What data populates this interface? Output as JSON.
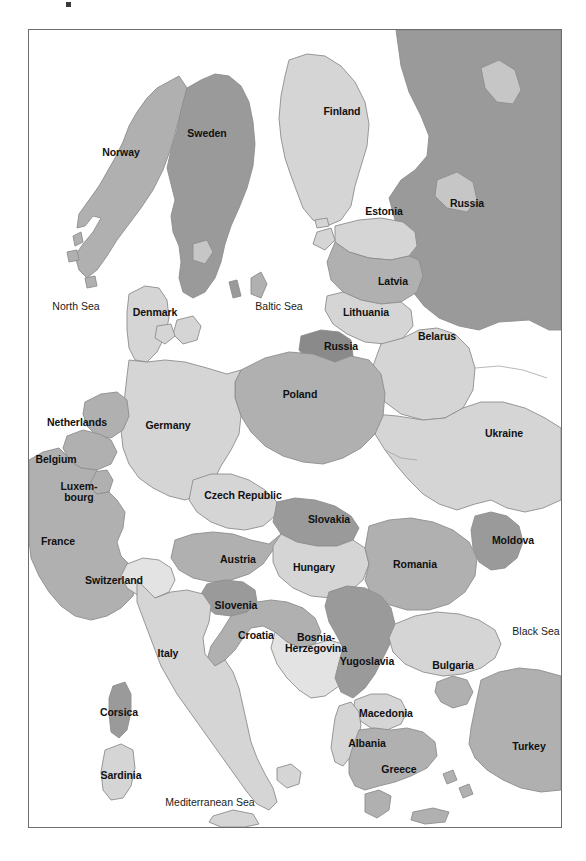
{
  "figure": {
    "kind": "political-map",
    "region": "Europe",
    "frame": {
      "x": 28,
      "y": 29,
      "width": 534,
      "height": 799,
      "border_color": "#6d6d6d"
    },
    "background": "#ffffff"
  },
  "palette": {
    "water": "#ffffff",
    "tone_lightest": "#e3e3e3",
    "tone_light": "#d5d5d5",
    "tone_medium_light": "#c6c6c6",
    "tone_medium": "#b0b0b0",
    "tone_medium_dark": "#9a9a9a",
    "tone_dark": "#8a8a8a",
    "tone_darkest": "#7b7b7b",
    "border_line": "#8d8d8d",
    "frame_line": "#6d6d6d",
    "label_text": "#111111"
  },
  "labels": {
    "countries": [
      {
        "name": "Norway",
        "text": "Norway",
        "x": 92,
        "y": 123,
        "tone": "tone_medium"
      },
      {
        "name": "Sweden",
        "text": "Sweden",
        "x": 178,
        "y": 104,
        "tone": "tone_medium_dark"
      },
      {
        "name": "Finland",
        "text": "Finland",
        "x": 313,
        "y": 82,
        "tone": "tone_light"
      },
      {
        "name": "Russia",
        "text": "Russia",
        "x": 438,
        "y": 174,
        "tone": "tone_medium_dark"
      },
      {
        "name": "Estonia",
        "text": "Estonia",
        "x": 355,
        "y": 182,
        "tone": "tone_light"
      },
      {
        "name": "Latvia",
        "text": "Latvia",
        "x": 364,
        "y": 252,
        "tone": "tone_medium"
      },
      {
        "name": "Lithuania",
        "text": "Lithuania",
        "x": 337,
        "y": 283,
        "tone": "tone_light"
      },
      {
        "name": "Denmark",
        "text": "Denmark",
        "x": 126,
        "y": 283,
        "tone": "tone_light"
      },
      {
        "name": "Russia-Kaliningrad",
        "text": "Russia",
        "x": 312,
        "y": 317,
        "tone": "tone_dark"
      },
      {
        "name": "Belarus",
        "text": "Belarus",
        "x": 408,
        "y": 307,
        "tone": "tone_light"
      },
      {
        "name": "Poland",
        "text": "Poland",
        "x": 271,
        "y": 365,
        "tone": "tone_medium"
      },
      {
        "name": "Netherlands",
        "text": "Netherlands",
        "x": 48,
        "y": 393,
        "tone": "tone_medium"
      },
      {
        "name": "Germany",
        "text": "Germany",
        "x": 139,
        "y": 396,
        "tone": "tone_light"
      },
      {
        "name": "Ukraine",
        "text": "Ukraine",
        "x": 475,
        "y": 404,
        "tone": "tone_light"
      },
      {
        "name": "Belgium",
        "text": "Belgium",
        "x": 27,
        "y": 430,
        "tone": "tone_medium"
      },
      {
        "name": "Luxembourg",
        "text": "Luxem-\nbourg",
        "x": 50,
        "y": 462,
        "tone": "tone_medium",
        "two_line": true
      },
      {
        "name": "Czech-Republic",
        "text": "Czech Republic",
        "x": 214,
        "y": 466,
        "tone": "tone_light"
      },
      {
        "name": "Slovakia",
        "text": "Slovakia",
        "x": 300,
        "y": 490,
        "tone": "tone_medium_dark"
      },
      {
        "name": "France",
        "text": "France",
        "x": 29,
        "y": 512,
        "tone": "tone_medium"
      },
      {
        "name": "Moldova",
        "text": "Moldova",
        "x": 484,
        "y": 511,
        "tone": "tone_medium_dark"
      },
      {
        "name": "Austria",
        "text": "Austria",
        "x": 209,
        "y": 530,
        "tone": "tone_medium"
      },
      {
        "name": "Hungary",
        "text": "Hungary",
        "x": 285,
        "y": 538,
        "tone": "tone_light"
      },
      {
        "name": "Romania",
        "text": "Romania",
        "x": 386,
        "y": 535,
        "tone": "tone_medium"
      },
      {
        "name": "Switzerland",
        "text": "Switzerland",
        "x": 85,
        "y": 551,
        "tone": "tone_lightest"
      },
      {
        "name": "Slovenia",
        "text": "Slovenia",
        "x": 207,
        "y": 576,
        "tone": "tone_medium_dark"
      },
      {
        "name": "Croatia",
        "text": "Croatia",
        "x": 227,
        "y": 606,
        "tone": "tone_medium"
      },
      {
        "name": "Bosnia-Herzegovina",
        "text": "Bosnia-\nHerzegovina",
        "x": 287,
        "y": 613,
        "tone": "tone_lightest",
        "two_line": true
      },
      {
        "name": "Italy",
        "text": "Italy",
        "x": 139,
        "y": 624,
        "tone": "tone_light"
      },
      {
        "name": "Yugoslavia",
        "text": "Yugoslavia",
        "x": 338,
        "y": 632,
        "tone": "tone_medium_dark"
      },
      {
        "name": "Bulgaria",
        "text": "Bulgaria",
        "x": 424,
        "y": 636,
        "tone": "tone_light"
      },
      {
        "name": "Macedonia",
        "text": "Macedonia",
        "x": 357,
        "y": 684,
        "tone": "tone_light"
      },
      {
        "name": "Corsica",
        "text": "Corsica",
        "x": 90,
        "y": 683,
        "tone": "tone_medium_dark"
      },
      {
        "name": "Albania",
        "text": "Albania",
        "x": 338,
        "y": 714,
        "tone": "tone_light"
      },
      {
        "name": "Turkey",
        "text": "Turkey",
        "x": 500,
        "y": 717,
        "tone": "tone_medium"
      },
      {
        "name": "Greece",
        "text": "Greece",
        "x": 370,
        "y": 740,
        "tone": "tone_medium"
      },
      {
        "name": "Sardinia",
        "text": "Sardinia",
        "x": 92,
        "y": 746,
        "tone": "tone_light"
      }
    ],
    "seas": [
      {
        "name": "North-Sea",
        "text": "North Sea",
        "x": 47,
        "y": 277
      },
      {
        "name": "Baltic-Sea",
        "text": "Baltic Sea",
        "x": 250,
        "y": 277
      },
      {
        "name": "Black-Sea",
        "text": "Black Sea",
        "x": 507,
        "y": 602
      },
      {
        "name": "Mediterranean-Sea",
        "text": "Mediterranean Sea",
        "x": 181,
        "y": 773
      }
    ]
  }
}
